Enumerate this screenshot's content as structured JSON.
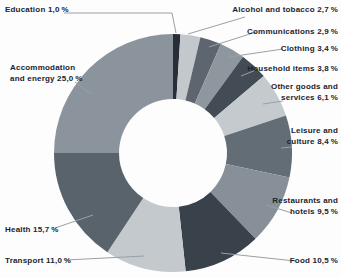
{
  "page": {
    "background": "#fdfdfd"
  },
  "chart_data": {
    "type": "pie",
    "subtype": "donut",
    "unit": "%",
    "decimal_separator": ",",
    "start_angle_deg": 0,
    "direction": "clockwise",
    "legend_position": "none",
    "categories": [
      "Education",
      "Alcohol and tobacco",
      "Communications",
      "Clothing",
      "Household items",
      "Other goods and services",
      "Leisure and culture",
      "Restaurants and hotels",
      "Food",
      "Transport",
      "Health",
      "Accommodation and energy"
    ],
    "values": [
      1.0,
      2.7,
      2.9,
      3.4,
      3.8,
      6.1,
      8.4,
      9.5,
      10.5,
      11.0,
      15.7,
      25.0
    ],
    "colors": [
      "#272e35",
      "#c2c8cb",
      "#5d666e",
      "#8f979e",
      "#434c54",
      "#c4cacd",
      "#636d76",
      "#879098",
      "#39424a",
      "#c3c9cd",
      "#59636c",
      "#8b949c"
    ],
    "geometry": {
      "cx": 173,
      "cy": 153,
      "outer_radius": 119,
      "inner_radius": 54
    },
    "leader_line_color": "#9aa0a4",
    "label_text_color": "#1a2430",
    "labels": [
      {
        "name": "education",
        "lines": [
          "Education 1,0 %"
        ],
        "align": "left",
        "x": 5,
        "top": 4,
        "leader": [
          [
            64,
            13
          ],
          [
            172,
            13
          ],
          [
            176,
            33
          ]
        ]
      },
      {
        "name": "alcohol-tobacco",
        "lines": [
          "Alcohol and tobacco 2,7 %"
        ],
        "align": "right",
        "right": 3,
        "top": 4,
        "leader": [
          [
            245,
            17
          ],
          [
            188,
            34
          ]
        ]
      },
      {
        "name": "communications",
        "lines": [
          "Communications 2,9 %"
        ],
        "align": "right",
        "right": 3,
        "top": 26,
        "leader": [
          [
            256,
            32
          ],
          [
            209,
            47
          ]
        ]
      },
      {
        "name": "clothing",
        "lines": [
          "Clothing 3,4 %"
        ],
        "align": "right",
        "right": 3,
        "top": 43,
        "leader": [
          [
            283,
            49
          ],
          [
            229,
            57
          ]
        ]
      },
      {
        "name": "household-items",
        "lines": [
          "Household items 3,8 %"
        ],
        "align": "right",
        "right": 3,
        "top": 63,
        "leader": [
          [
            256,
            70
          ],
          [
            241,
            76
          ]
        ]
      },
      {
        "name": "other-goods-services",
        "lines": [
          "Other goods and",
          "services 6,1 %"
        ],
        "align": "right",
        "right": 3,
        "top": 81,
        "leader": [
          [
            283,
            101
          ],
          [
            263,
            104
          ]
        ]
      },
      {
        "name": "leisure-culture",
        "lines": [
          "Leisure and",
          "culture 8,4 %"
        ],
        "align": "right",
        "right": 3,
        "top": 125,
        "leader": [
          [
            292,
            147
          ],
          [
            281,
            148
          ]
        ]
      },
      {
        "name": "restaurants-hotels",
        "lines": [
          "Restaurants and",
          "hotels 9,5 %"
        ],
        "align": "right",
        "right": 3,
        "top": 195,
        "leader": [
          [
            292,
            213
          ],
          [
            266,
            205
          ]
        ]
      },
      {
        "name": "food",
        "lines": [
          "Food 10,5 %"
        ],
        "align": "right",
        "right": 3,
        "top": 255,
        "leader": [
          [
            295,
            261
          ],
          [
            221,
            253
          ]
        ]
      },
      {
        "name": "transport",
        "lines": [
          "Transport 11,0 %"
        ],
        "align": "left",
        "x": 5,
        "top": 255,
        "leader": [
          [
            66,
            260
          ],
          [
            144,
            256
          ]
        ]
      },
      {
        "name": "health",
        "lines": [
          "Health 15,7 %"
        ],
        "align": "left",
        "x": 5,
        "top": 224,
        "leader": [
          [
            55,
            228
          ],
          [
            93,
            215
          ]
        ]
      },
      {
        "name": "accommodation-energy",
        "lines": [
          "Accommodation",
          "and energy  25,0 %"
        ],
        "align": "left",
        "x": 10,
        "top": 62,
        "leader": [
          [
            75,
            82
          ],
          [
            91,
            94
          ]
        ]
      }
    ]
  }
}
